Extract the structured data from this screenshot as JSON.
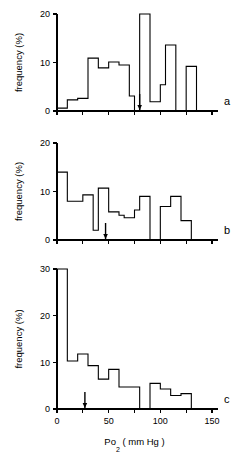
{
  "figure": {
    "axis_titles": {
      "y": "frequency  (%)",
      "x_main": "Po",
      "x_sub": "2",
      "x_units": "( mm Hg )"
    },
    "panel_letters": {
      "a": "a",
      "b": "b",
      "c": "c"
    },
    "x_tick_labels": [
      "0",
      "50",
      "100",
      "150"
    ],
    "y_tick_labels_a": [
      "0",
      "10",
      "20"
    ],
    "y_tick_labels_b": [
      "0",
      "10",
      "20"
    ],
    "y_tick_labels_c": [
      "0",
      "10",
      "20",
      "30"
    ]
  },
  "chart_data": [
    {
      "type": "bar",
      "id": "panel-a",
      "title": "",
      "panel_label": "a",
      "xlabel": "Po2 (mm Hg)",
      "ylabel": "frequency (%)",
      "xlim": [
        0,
        150
      ],
      "ylim": [
        0,
        20
      ],
      "x_ticks": [
        0,
        25,
        50,
        75,
        100,
        125,
        150
      ],
      "x_tick_labels": [
        "0",
        "",
        "50",
        "",
        "100",
        "",
        "150"
      ],
      "y_ticks": [
        0,
        10,
        20
      ],
      "grid": false,
      "legend": null,
      "bin_width": 5,
      "bin_edges": [
        0,
        5,
        10,
        15,
        20,
        25,
        30,
        35,
        40,
        45,
        50,
        55,
        60,
        65,
        70,
        75,
        80,
        85,
        90,
        95,
        100,
        105,
        110,
        115,
        120,
        125,
        130,
        135,
        140
      ],
      "categories": [
        "0-5",
        "5-10",
        "10-15",
        "15-20",
        "20-25",
        "25-30",
        "30-35",
        "35-40",
        "40-45",
        "45-50",
        "50-55",
        "55-60",
        "60-65",
        "65-70",
        "70-75",
        "75-80",
        "80-85",
        "85-90",
        "90-95",
        "95-100",
        "100-105",
        "105-110",
        "110-115",
        "115-120",
        "120-125",
        "125-130",
        "130-135",
        "135-140"
      ],
      "values": [
        0.6,
        0.6,
        2.3,
        2.3,
        2.6,
        2.6,
        10.9,
        10.9,
        8.9,
        8.9,
        10.1,
        10.1,
        9.5,
        9.5,
        3.1,
        0.0,
        20.0,
        20.0,
        1.9,
        1.9,
        5.4,
        13.6,
        13.6,
        0.0,
        0.0,
        9.2,
        9.2,
        0.0
      ],
      "annotations": [
        {
          "type": "arrow",
          "x": 80,
          "y": 0,
          "direction": "down",
          "label": ""
        }
      ]
    },
    {
      "type": "bar",
      "id": "panel-b",
      "title": "",
      "panel_label": "b",
      "xlabel": "Po2 (mm Hg)",
      "ylabel": "frequency (%)",
      "xlim": [
        0,
        150
      ],
      "ylim": [
        0,
        20
      ],
      "x_ticks": [
        0,
        25,
        50,
        75,
        100,
        125,
        150
      ],
      "x_tick_labels": [
        "0",
        "",
        "50",
        "",
        "100",
        "",
        "150"
      ],
      "y_ticks": [
        0,
        10,
        20
      ],
      "grid": false,
      "legend": null,
      "bin_width": 5,
      "bin_edges": [
        0,
        5,
        10,
        15,
        20,
        25,
        30,
        35,
        40,
        45,
        50,
        55,
        60,
        65,
        70,
        75,
        80,
        85,
        90,
        95,
        100,
        105,
        110,
        115,
        120,
        125,
        130,
        135,
        140
      ],
      "categories": [
        "0-5",
        "5-10",
        "10-15",
        "15-20",
        "20-25",
        "25-30",
        "30-35",
        "35-40",
        "40-45",
        "45-50",
        "50-55",
        "55-60",
        "60-65",
        "65-70",
        "70-75",
        "75-80",
        "80-85",
        "85-90",
        "90-95",
        "95-100",
        "100-105",
        "105-110",
        "110-115",
        "115-120",
        "120-125",
        "125-130",
        "130-135",
        "135-140"
      ],
      "values": [
        14.0,
        14.0,
        8.0,
        8.0,
        8.0,
        9.3,
        9.3,
        2.0,
        10.7,
        10.7,
        5.8,
        5.8,
        5.1,
        4.6,
        4.6,
        6.2,
        9.0,
        9.0,
        0.0,
        0.0,
        6.9,
        6.9,
        9.0,
        9.0,
        4.0,
        4.0,
        0.0,
        0.0
      ],
      "annotations": [
        {
          "type": "arrow",
          "x": 47,
          "y": 0,
          "direction": "down",
          "label": ""
        }
      ]
    },
    {
      "type": "bar",
      "id": "panel-c",
      "title": "",
      "panel_label": "c",
      "xlabel": "Po2 (mm Hg)",
      "ylabel": "frequency (%)",
      "xlim": [
        0,
        150
      ],
      "ylim": [
        0,
        30
      ],
      "x_ticks": [
        0,
        25,
        50,
        75,
        100,
        125,
        150
      ],
      "x_tick_labels": [
        "0",
        "",
        "50",
        "",
        "100",
        "",
        "150"
      ],
      "y_ticks": [
        0,
        10,
        20,
        30
      ],
      "grid": false,
      "legend": null,
      "bin_width": 10,
      "bin_edges": [
        0,
        10,
        20,
        30,
        40,
        50,
        60,
        70,
        80,
        90,
        100,
        110,
        120,
        130
      ],
      "categories": [
        "0-10",
        "10-20",
        "20-30",
        "30-40",
        "40-50",
        "50-60",
        "60-70",
        "70-80",
        "80-90",
        "90-100",
        "100-110",
        "110-120",
        "120-130"
      ],
      "values": [
        30.0,
        10.3,
        11.8,
        9.3,
        6.4,
        8.5,
        4.7,
        4.7,
        0.0,
        5.5,
        4.3,
        2.9,
        3.3
      ],
      "annotations": [
        {
          "type": "arrow",
          "x": 27,
          "y": 0,
          "direction": "down",
          "label": ""
        }
      ]
    }
  ]
}
